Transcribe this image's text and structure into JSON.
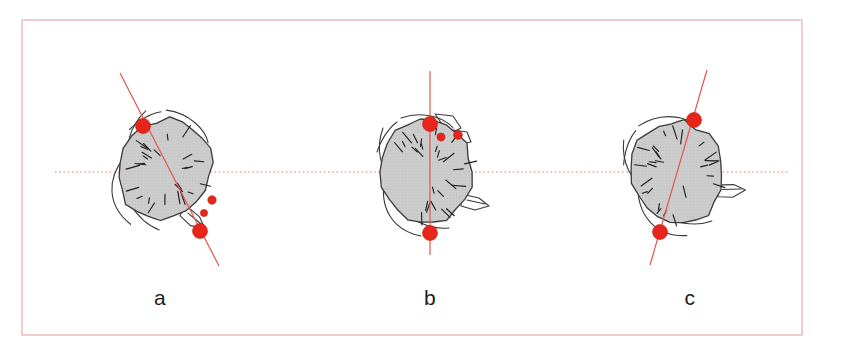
{
  "figure": {
    "background_color": "#ffffff",
    "frame": {
      "name": "figure-border",
      "color": "#f0b7b7",
      "x": 22,
      "y": 20,
      "width": 780,
      "height": 315,
      "stroke_width": 1.4
    },
    "reference_line": {
      "name": "horizontal-reference-axis",
      "style": "dotted",
      "color": "#e2736f",
      "y": 172
    },
    "marker": {
      "name": "landmark-dot",
      "color": "#e8251a",
      "edge_color": "#c01b10"
    },
    "axis_line": {
      "name": "measurement-axis",
      "color": "#e2564f"
    },
    "head": {
      "fill": "#cccccc",
      "outline": "#3a3a3a",
      "hatch_color": "#1f1f1f"
    },
    "body_outline_color": "#3a3a3a"
  },
  "panels": [
    {
      "id": "a",
      "label": "a",
      "label_x": 160,
      "label_y": 305,
      "center_x": 165,
      "center_y": 170,
      "axis_angle_deg": 27,
      "axis": {
        "x1": 120,
        "y1": 73,
        "x2": 219,
        "y2": 266
      },
      "markers": [
        {
          "name": "marker-upper",
          "cx": 143,
          "cy": 126,
          "r": 7.5
        },
        {
          "name": "marker-lower",
          "cx": 200,
          "cy": 231,
          "r": 7.5
        },
        {
          "name": "marker-ear-upper",
          "cx": 212,
          "cy": 200,
          "r": 4.2
        },
        {
          "name": "marker-ear-lower",
          "cx": 204,
          "cy": 213,
          "r": 3.6
        }
      ]
    },
    {
      "id": "b",
      "label": "b",
      "label_x": 430,
      "label_y": 305,
      "center_x": 427,
      "center_y": 172,
      "axis_angle_deg": 0,
      "axis": {
        "x1": 430,
        "y1": 71,
        "x2": 430,
        "y2": 255
      },
      "markers": [
        {
          "name": "marker-upper",
          "cx": 430,
          "cy": 124,
          "r": 7.5
        },
        {
          "name": "marker-lower",
          "cx": 430,
          "cy": 233,
          "r": 7.5
        },
        {
          "name": "marker-ear-inner",
          "cx": 441,
          "cy": 137,
          "r": 4.0
        },
        {
          "name": "marker-ear-outer",
          "cx": 458,
          "cy": 135,
          "r": 4.4
        }
      ]
    },
    {
      "id": "c",
      "label": "c",
      "label_x": 690,
      "label_y": 305,
      "center_x": 677,
      "center_y": 172,
      "axis_angle_deg": -14,
      "axis": {
        "x1": 707,
        "y1": 70,
        "x2": 650,
        "y2": 265
      },
      "markers": [
        {
          "name": "marker-upper",
          "cx": 694,
          "cy": 120,
          "r": 7.5
        },
        {
          "name": "marker-lower",
          "cx": 660,
          "cy": 232,
          "r": 7.5
        }
      ]
    }
  ]
}
